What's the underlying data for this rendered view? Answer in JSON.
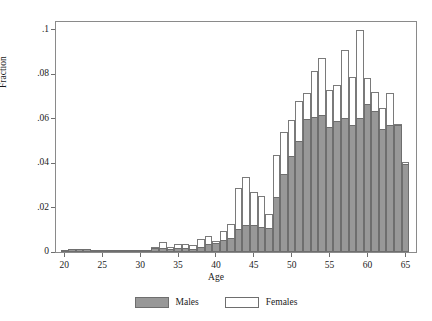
{
  "chart_data": {
    "type": "bar",
    "title": "",
    "xlabel": "Age",
    "ylabel": "Fraction",
    "xlim": [
      18.9,
      66.4
    ],
    "ylim": [
      0,
      0.1035
    ],
    "xticks": [
      20,
      25,
      30,
      35,
      40,
      45,
      50,
      55,
      60,
      65
    ],
    "xtick_labels": [
      "20",
      "25",
      "30",
      "35",
      "40",
      "45",
      "50",
      "55",
      "60",
      "65"
    ],
    "yticks": [
      0,
      0.02,
      0.04,
      0.06,
      0.08,
      0.1
    ],
    "ytick_labels": [
      "0",
      ".02",
      ".04",
      ".06",
      ".08",
      ".1"
    ],
    "grid": false,
    "legend_position": "bottom",
    "bin_width": 1,
    "categories": [
      20,
      21,
      22,
      23,
      24,
      25,
      26,
      27,
      28,
      29,
      30,
      31,
      32,
      33,
      34,
      35,
      36,
      37,
      38,
      39,
      40,
      41,
      42,
      43,
      44,
      45,
      46,
      47,
      48,
      49,
      50,
      51,
      52,
      53,
      54,
      55,
      56,
      57,
      58,
      59,
      60,
      61,
      62,
      63,
      64,
      65
    ],
    "series": [
      {
        "name": "Males",
        "color": "#989898",
        "values": [
          0.0009,
          0.0013,
          0.0013,
          0.0013,
          0.0009,
          0.0002,
          0.0004,
          0.0005,
          0.0003,
          0.0002,
          0.0003,
          0.0006,
          0.0016,
          0.0018,
          0.0012,
          0.0017,
          0.0019,
          0.0015,
          0.0022,
          0.0035,
          0.0041,
          0.0052,
          0.0061,
          0.0104,
          0.0122,
          0.0121,
          0.0112,
          0.0107,
          0.0246,
          0.0352,
          0.043,
          0.0501,
          0.0597,
          0.0607,
          0.0617,
          0.0562,
          0.0588,
          0.0601,
          0.0573,
          0.0602,
          0.0665,
          0.0635,
          0.0555,
          0.0572,
          0.0572,
          0.0394
        ]
      },
      {
        "name": "Females",
        "color": "#ffffff",
        "values": [
          0.0011,
          0.0014,
          0.0013,
          0.0012,
          0.0009,
          0.0002,
          0.0003,
          0.0004,
          0.0003,
          0.0002,
          0.0003,
          0.0008,
          0.0023,
          0.0045,
          0.0024,
          0.0038,
          0.0034,
          0.0032,
          0.0058,
          0.007,
          0.0049,
          0.0095,
          0.0128,
          0.0286,
          0.0336,
          0.027,
          0.0254,
          0.0171,
          0.0435,
          0.0541,
          0.0596,
          0.0679,
          0.0717,
          0.0813,
          0.0873,
          0.0727,
          0.075,
          0.0911,
          0.0789,
          0.0999,
          0.0782,
          0.0719,
          0.0646,
          0.0717,
          0.0578,
          0.0404
        ]
      }
    ]
  },
  "axes": {
    "y_title": "Fraction",
    "x_title": "Age"
  },
  "legend": {
    "entries": [
      {
        "label": "Males",
        "swatch": "filled-gray-swatch"
      },
      {
        "label": "Females",
        "swatch": "outlined-white-swatch"
      }
    ]
  }
}
